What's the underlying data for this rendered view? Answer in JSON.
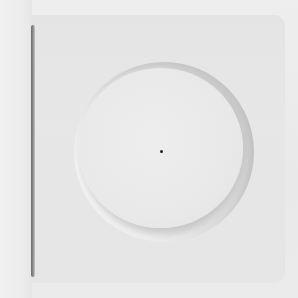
{
  "image": {
    "subject": "square plate with circular recess",
    "colors": {
      "background": "#ececec",
      "plate": "#e6e6e6",
      "edge_shadow": "#6a6a6a",
      "center_dot": "#222222"
    }
  }
}
